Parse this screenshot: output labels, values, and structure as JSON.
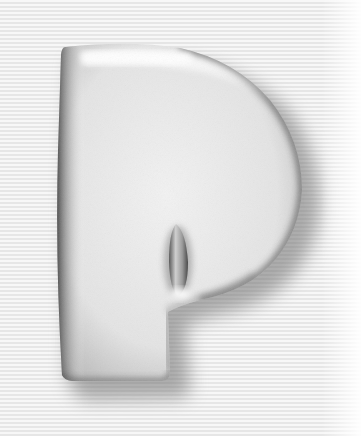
{
  "image": {
    "subject": "Glossy 3D letter on striped background",
    "letter": "P"
  },
  "background": {
    "pattern": "horizontal-stripes",
    "stripe_light": "#f7f7f7",
    "stripe_dark": "#e6e6e6"
  },
  "colors": {
    "letter_face": "#ececec",
    "letter_edge": "#3a3a3a",
    "highlight": "#ffffff",
    "shadow": "#6e6e6e"
  }
}
